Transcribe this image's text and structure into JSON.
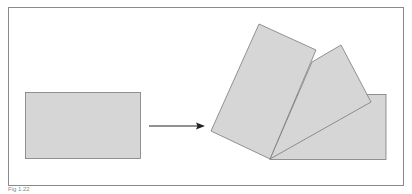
{
  "figure": {
    "caption": "Fig 1.22",
    "colors": {
      "frame": "#8a8a8a",
      "shape_fill": "#d6d6d6",
      "shape_stroke": "#7a7a7a",
      "arrow": "#222222"
    }
  }
}
